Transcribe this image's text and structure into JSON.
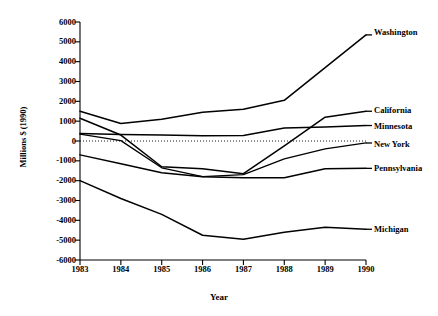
{
  "figure": {
    "title": "",
    "background": "#ffffff",
    "ink": "#000000"
  },
  "axes": {
    "ylabel": "Millions $ (1990)",
    "xlabel": "Year",
    "yticks": [
      "6000",
      "5000",
      "4000",
      "3000",
      "2000",
      "1000",
      "0",
      "-1000",
      "-2000",
      "-3000",
      "-4000",
      "-5000",
      "-6000"
    ],
    "xticks": [
      "1983",
      "1984",
      "1985",
      "1986",
      "1987",
      "1988",
      "1989",
      "1990"
    ]
  },
  "labels": {
    "washington": "Washington",
    "california": "California",
    "minnesota": "Minnesota",
    "newyork": "New York",
    "pennsylvania": "Pennsylvania",
    "michigan": "Michigan"
  },
  "chart_data": {
    "type": "line",
    "title": "",
    "xlabel": "Year",
    "ylabel": "Millions $ (1990)",
    "x": [
      1983,
      1984,
      1985,
      1986,
      1987,
      1988,
      1989,
      1990
    ],
    "xlim": [
      1983,
      1990
    ],
    "ylim": [
      -6000,
      6000
    ],
    "ytick_step": 1000,
    "grid": false,
    "zero_line": true,
    "zero_line_style": "dotted",
    "legend_position": "right-of-axes-inline",
    "series": [
      {
        "name": "Washington",
        "style": "solid",
        "color": "#000000",
        "values": [
          1500,
          880,
          1100,
          1450,
          1600,
          2050,
          3700,
          5350
        ]
      },
      {
        "name": "California",
        "style": "solid",
        "color": "#000000",
        "values": [
          1150,
          300,
          -1300,
          -1400,
          -1650,
          -250,
          1200,
          1500
        ]
      },
      {
        "name": "Minnesota",
        "style": "solid",
        "color": "#000000",
        "values": [
          380,
          330,
          300,
          260,
          280,
          650,
          700,
          780
        ]
      },
      {
        "name": "New York",
        "style": "dotted",
        "color": "#000000",
        "values": [
          350,
          20,
          -1350,
          -1800,
          -1700,
          -900,
          -400,
          -100
        ]
      },
      {
        "name": "Pennsylvania",
        "style": "solid",
        "color": "#000000",
        "values": [
          -700,
          -1150,
          -1600,
          -1800,
          -1850,
          -1850,
          -1400,
          -1380
        ]
      },
      {
        "name": "Michigan",
        "style": "solid",
        "color": "#000000",
        "values": [
          -2000,
          -2900,
          -3700,
          -4750,
          -4950,
          -4600,
          -4350,
          -4450
        ]
      }
    ]
  }
}
